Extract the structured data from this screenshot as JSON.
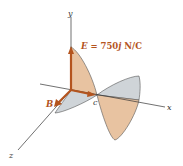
{
  "figure": {
    "type": "electromagnetic-wave-diagram",
    "axes": {
      "x_label": "x",
      "y_label": "y",
      "z_label": "z"
    },
    "vectors": {
      "E_label": "E = 750j N/C",
      "E_symbol": "E",
      "E_rest": " = 750",
      "E_unit_vec": "j",
      "E_units": " N/C",
      "B_label": "B",
      "c_label": "c"
    },
    "colors": {
      "axis": "#333333",
      "vector": "#b4541e",
      "label": "#b4541e",
      "e_wave_fill": "#e8c3a1",
      "b_wave_fill": "#cfd4d8",
      "wave_outline": "#555555"
    }
  }
}
